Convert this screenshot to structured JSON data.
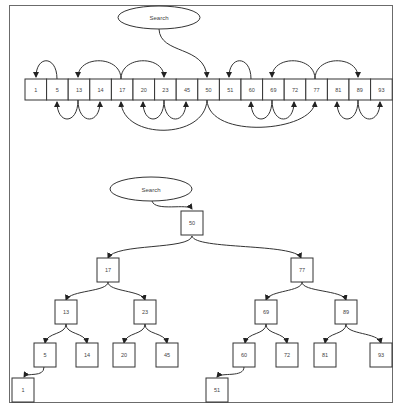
{
  "diagram": {
    "type": "binary-search-illustration",
    "array_view": {
      "search_label": "Search",
      "cells": [
        "1",
        "5",
        "13",
        "14",
        "17",
        "20",
        "23",
        "45",
        "50",
        "51",
        "60",
        "69",
        "72",
        "77",
        "81",
        "89",
        "93"
      ],
      "start_index": 8,
      "arrows_above": [
        {
          "from": 1,
          "to": 0
        },
        {
          "from": 4,
          "to": 2
        },
        {
          "from": 4,
          "to": 6
        },
        {
          "from": 10,
          "to": 9
        },
        {
          "from": 13,
          "to": 11
        },
        {
          "from": 13,
          "to": 15
        }
      ],
      "arrows_below": [
        {
          "from": 2,
          "to": 1
        },
        {
          "from": 2,
          "to": 3
        },
        {
          "from": 8,
          "to": 4
        },
        {
          "from": 6,
          "to": 5
        },
        {
          "from": 6,
          "to": 7
        },
        {
          "from": 8,
          "to": 13
        },
        {
          "from": 11,
          "to": 10
        },
        {
          "from": 11,
          "to": 12
        },
        {
          "from": 15,
          "to": 14
        },
        {
          "from": 15,
          "to": 16
        }
      ]
    },
    "tree_view": {
      "search_label": "Search",
      "nodes": {
        "root": "50",
        "l": "17",
        "r": "77",
        "ll": "13",
        "lr": "23",
        "rl": "69",
        "rr": "89",
        "lll": "5",
        "llr": "14",
        "lrl": "20",
        "lrr": "45",
        "rll": "60",
        "rlr": "72",
        "rrl": "81",
        "rrr": "93",
        "llll": "1",
        "rlll": "51"
      }
    },
    "colors": {
      "stroke": "#333333",
      "frame": "#6b6b6b",
      "text": "#444444",
      "background": "#ffffff"
    }
  }
}
